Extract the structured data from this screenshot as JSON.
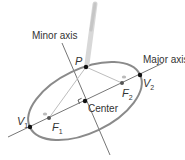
{
  "diagram": {
    "labels": {
      "minor_axis": "Minor axis",
      "major_axis": "Major axis",
      "point": "P",
      "center": "Center",
      "vertex1": "V",
      "vertex1_sub": "1",
      "vertex2": "V",
      "vertex2_sub": "2",
      "focus1": "F",
      "focus1_sub": "1",
      "focus2": "F",
      "focus2_sub": "2"
    },
    "colors": {
      "ellipse": "#8a8a8a",
      "axis_lines": "#666666",
      "string": "#b8b8b8",
      "points": "#111111",
      "text": "#333333"
    }
  }
}
